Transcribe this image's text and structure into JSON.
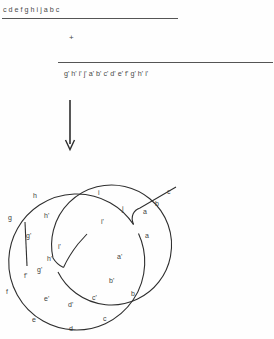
{
  "figure": {
    "type": "molecular-biology-schematic"
  },
  "top_section": {
    "strand_top": {
      "label": "c d e f g h i j a b c",
      "letters": [
        "c",
        "d",
        "e",
        "f",
        "g",
        "h",
        "i",
        "j",
        "a",
        "b",
        "c"
      ],
      "positions_x": [
        3,
        20,
        37,
        54,
        70,
        87,
        104,
        122,
        140,
        157,
        172
      ]
    },
    "plus_sign": "+",
    "strand_bottom": {
      "label": "g' h' i' j' a' b' c' d' e' f' g' h' i'",
      "letters": [
        "g'",
        "h'",
        "i'",
        "j'",
        "a'",
        "b'",
        "c'",
        "d'",
        "e'",
        "f'",
        "g'",
        "h'",
        "i'"
      ],
      "positions_x": [
        64,
        81,
        99,
        117,
        134,
        151,
        169,
        186,
        203,
        220,
        237,
        253,
        268
      ]
    },
    "arrow": "downward-arrow"
  },
  "circle_diagram": {
    "outer_ring_labels": [
      {
        "text": "h",
        "x": 33,
        "y": 192
      },
      {
        "text": "i",
        "x": 98,
        "y": 189
      },
      {
        "text": "j",
        "x": 122,
        "y": 205
      },
      {
        "text": "g",
        "x": 8,
        "y": 214
      },
      {
        "text": "a",
        "x": 145,
        "y": 232
      },
      {
        "text": "b",
        "x": 131,
        "y": 290
      },
      {
        "text": "f",
        "x": 6,
        "y": 288
      },
      {
        "text": "e",
        "x": 32,
        "y": 316
      },
      {
        "text": "d",
        "x": 69,
        "y": 325
      },
      {
        "text": "c",
        "x": 103,
        "y": 315
      }
    ],
    "inner_ring_labels": [
      {
        "text": "h'",
        "x": 44,
        "y": 212
      },
      {
        "text": "i'",
        "x": 101,
        "y": 218
      },
      {
        "text": "g'",
        "x": 26,
        "y": 232
      },
      {
        "text": "a'",
        "x": 117,
        "y": 253
      },
      {
        "text": "b'",
        "x": 109,
        "y": 277
      },
      {
        "text": "f'",
        "x": 24,
        "y": 272
      },
      {
        "text": "g'",
        "x": 37,
        "y": 266
      },
      {
        "text": "h'",
        "x": 47,
        "y": 255
      },
      {
        "text": "i'",
        "x": 58,
        "y": 243
      },
      {
        "text": "e'",
        "x": 44,
        "y": 295
      },
      {
        "text": "d'",
        "x": 68,
        "y": 301
      },
      {
        "text": "c'",
        "x": 92,
        "y": 294
      }
    ],
    "tail_labels": [
      {
        "text": "a",
        "x": 143,
        "y": 208
      },
      {
        "text": "b",
        "x": 155,
        "y": 200
      },
      {
        "text": "c",
        "x": 167,
        "y": 188
      }
    ]
  }
}
